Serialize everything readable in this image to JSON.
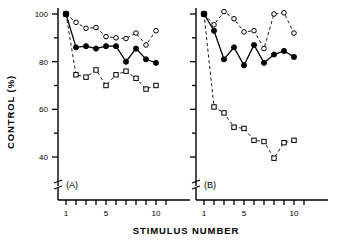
{
  "figure": {
    "xlabel": "STIMULUS   NUMBER",
    "ylabel": "CONTROL  (%)",
    "y_ticks_major": [
      "100",
      "80",
      "60",
      "40"
    ],
    "x_ticks_major": [
      "1",
      "5",
      "10"
    ]
  },
  "panels": {
    "a": {
      "label": "(A)"
    },
    "b": {
      "label": "(B)"
    }
  },
  "chart_data": [
    {
      "type": "line",
      "panel": "(A)",
      "title": "",
      "xlabel": "STIMULUS NUMBER",
      "ylabel": "CONTROL (%)",
      "xlim": [
        0.2,
        11.6
      ],
      "ylim": [
        30,
        102
      ],
      "y_axis_break": true,
      "grid": false,
      "legend": "none",
      "x": [
        1,
        2,
        3,
        4,
        5,
        6,
        7,
        8,
        9,
        10
      ],
      "series": [
        {
          "name": "open-circle",
          "marker": "circle-open",
          "linestyle": "dashed",
          "values": [
            100.0,
            96.5,
            94.0,
            94.3,
            90.5,
            90.0,
            89.7,
            92.0,
            87.0,
            93.0
          ]
        },
        {
          "name": "filled-circle",
          "marker": "circle-filled",
          "linestyle": "solid",
          "values": [
            100.0,
            86.0,
            86.5,
            85.5,
            86.5,
            86.5,
            80.0,
            85.5,
            81.0,
            79.5
          ]
        },
        {
          "name": "open-square",
          "marker": "square-open",
          "linestyle": "dashed",
          "values": [
            100.0,
            74.5,
            73.5,
            76.5,
            70.0,
            74.5,
            76.0,
            73.0,
            68.5,
            70.0
          ]
        }
      ]
    },
    {
      "type": "line",
      "panel": "(B)",
      "title": "",
      "xlabel": "STIMULUS NUMBER",
      "ylabel": "CONTROL (%)",
      "xlim": [
        0.2,
        11.6
      ],
      "ylim": [
        30,
        102
      ],
      "y_axis_break": true,
      "grid": false,
      "legend": "none",
      "x": [
        1,
        2,
        3,
        4,
        5,
        6,
        7,
        8,
        9,
        10
      ],
      "series": [
        {
          "name": "open-circle",
          "marker": "circle-open",
          "linestyle": "dashed",
          "values": [
            100.0,
            95.5,
            101.0,
            98.0,
            92.5,
            93.0,
            85.5,
            100.0,
            100.5,
            92.0
          ]
        },
        {
          "name": "filled-circle",
          "marker": "circle-filled",
          "linestyle": "solid",
          "values": [
            100.0,
            93.0,
            81.0,
            86.0,
            78.5,
            87.0,
            79.5,
            83.0,
            84.5,
            82.0
          ]
        },
        {
          "name": "open-square",
          "marker": "square-open",
          "linestyle": "dashed",
          "values": [
            100.0,
            61.0,
            58.5,
            52.5,
            52.0,
            47.0,
            46.5,
            39.5,
            46.0,
            47.0
          ]
        }
      ]
    }
  ]
}
